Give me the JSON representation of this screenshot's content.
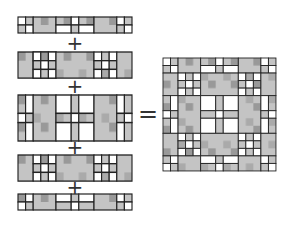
{
  "diagram": {
    "operators": {
      "plus": "+",
      "equals": "="
    },
    "rows": [
      {
        "name": "row-1",
        "height_units": 2
      },
      {
        "name": "row-2",
        "height_units": 3
      },
      {
        "name": "row-3",
        "height_units": 5
      },
      {
        "name": "row-4",
        "height_units": 3
      },
      {
        "name": "row-5",
        "height_units": 2
      }
    ],
    "colors": {
      "fill": "#b8b8b8",
      "stroke": "#222222",
      "light": "#ffffff"
    }
  }
}
